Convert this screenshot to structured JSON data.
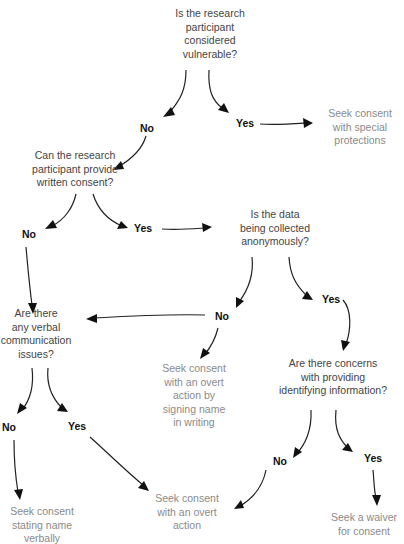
{
  "diagram": {
    "type": "decision-flowchart",
    "questions": [
      {
        "id": "q1",
        "lines": [
          "Is the research",
          "participant",
          "considered",
          "vulnerable?"
        ]
      },
      {
        "id": "q2",
        "lines": [
          "Can the research",
          "participant provide",
          "written consent?"
        ]
      },
      {
        "id": "q3",
        "lines": [
          "Is the data",
          "being collected",
          "anonymously?"
        ]
      },
      {
        "id": "q4",
        "lines": [
          "Are there",
          "any verbal",
          "communication",
          "issues?"
        ]
      },
      {
        "id": "q5",
        "lines": [
          "Are there concerns",
          "with providing",
          "identifying information?"
        ]
      }
    ],
    "outcomes": [
      {
        "id": "o1",
        "lines": [
          "Seek consent",
          "with special",
          "protections"
        ]
      },
      {
        "id": "o2",
        "lines": [
          "Seek consent",
          "with an overt",
          "action by",
          "signing name",
          "in writing"
        ]
      },
      {
        "id": "o3",
        "lines": [
          "Seek consent",
          "stating name",
          "verbally"
        ]
      },
      {
        "id": "o4",
        "lines": [
          "Seek consent",
          "with an overt",
          "action"
        ]
      },
      {
        "id": "o5",
        "lines": [
          "Seek a waiver",
          "for consent"
        ]
      }
    ],
    "labels": {
      "q1_no": "No",
      "q1_yes": "Yes",
      "q2_no": "No",
      "q2_yes": "Yes",
      "q3_no": "No",
      "q3_yes": "Yes",
      "q4_no": "No",
      "q4_yes": "Yes",
      "q5_no": "No",
      "q5_yes": "Yes"
    },
    "edges": [
      {
        "from": "q1",
        "label": "No",
        "to": "q2"
      },
      {
        "from": "q1",
        "label": "Yes",
        "to": "o1"
      },
      {
        "from": "q2",
        "label": "No",
        "to": "q4"
      },
      {
        "from": "q2",
        "label": "Yes",
        "to": "q3"
      },
      {
        "from": "q3",
        "label": "No",
        "to": "q4"
      },
      {
        "from": "q3",
        "label": "No",
        "to": "o2"
      },
      {
        "from": "q3",
        "label": "Yes",
        "to": "q5"
      },
      {
        "from": "q4",
        "label": "No",
        "to": "o3"
      },
      {
        "from": "q4",
        "label": "Yes",
        "to": "o4"
      },
      {
        "from": "q5",
        "label": "No",
        "to": "o4"
      },
      {
        "from": "q5",
        "label": "Yes",
        "to": "o5"
      }
    ]
  }
}
